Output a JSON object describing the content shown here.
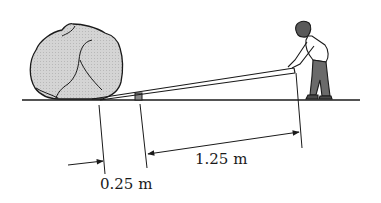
{
  "diagram": {
    "elements": {
      "boulder": "rock",
      "lever": "plank",
      "fulcrum": "small block",
      "person": "man pushing down on lever end",
      "ground": "ground line"
    },
    "dimensions": {
      "short_arm": "0.25 m",
      "long_arm": "1.25 m"
    },
    "colors": {
      "rock_fill": "#cfcfcf",
      "line": "#1a1a1a",
      "fulcrum_fill": "#8a8a8a"
    }
  }
}
